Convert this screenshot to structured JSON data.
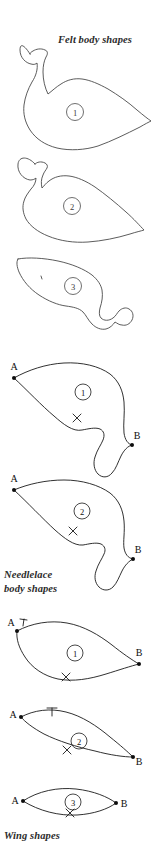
{
  "page": {
    "width": 159,
    "height": 856,
    "background_color": "#ffffff",
    "ink_color": "#4a4a4a",
    "dark_ink_color": "#1a1a1a"
  },
  "captions": {
    "felt": "Felt body shapes",
    "needlelace": "Needlelace\nbody shapes",
    "wing": "Wing shapes"
  },
  "sections": [
    {
      "id": "felt-body-shapes",
      "caption": "Felt body shapes",
      "pattern_pieces": [
        {
          "number": "1",
          "description": "bird body with head, neck and pointed tail"
        },
        {
          "number": "2",
          "description": "bird body with head and pointed tail"
        },
        {
          "number": "3",
          "description": "elongated body with small head bulge at right"
        }
      ]
    },
    {
      "id": "needlelace-body-shapes",
      "caption": "Needlelace\nbody shapes",
      "pattern_pieces": [
        {
          "number": "1",
          "point_a": "A",
          "point_b": "B",
          "has_cross_mark": true
        },
        {
          "number": "2",
          "point_a": "A",
          "point_b": "B",
          "has_cross_mark": true
        }
      ]
    },
    {
      "id": "wing-shapes",
      "caption": "Wing shapes",
      "pattern_pieces": [
        {
          "number": "1",
          "point_a": "A",
          "point_b": "B",
          "tick_label": "T",
          "has_cross_mark": true
        },
        {
          "number": "2",
          "point_a": "A",
          "point_b": "B",
          "tick_label": "T",
          "has_cross_mark": true
        },
        {
          "number": "3",
          "point_a": "A",
          "point_b": "B",
          "has_cross_mark": true
        }
      ]
    }
  ],
  "labels": {
    "a": "A",
    "b": "B",
    "t": "T",
    "n1": "1",
    "n2": "2",
    "n3": "3"
  }
}
